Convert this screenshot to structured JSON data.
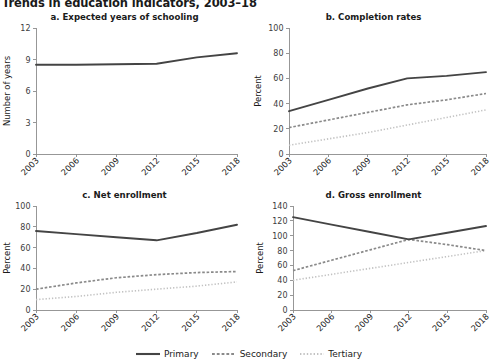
{
  "figure": {
    "title": "Trends in education indicators, 2003–18"
  },
  "legend": {
    "position": "bottom-center",
    "items": [
      {
        "label": "Primary",
        "style": "solid",
        "color": "#444444",
        "icon": "solid-line-swatch-icon"
      },
      {
        "label": "Secondary",
        "style": "dashed",
        "color": "#8a8a8a",
        "icon": "dashed-line-swatch-icon"
      },
      {
        "label": "Tertiary",
        "style": "dotted",
        "color": "#c2c2c2",
        "icon": "dotted-line-swatch-icon"
      }
    ]
  },
  "chart_data": [
    {
      "id": "panel-a",
      "type": "line",
      "title": "a. Expected years of schooling",
      "xlabel": "",
      "ylabel": "Number of years",
      "x": [
        2003,
        2006,
        2009,
        2012,
        2015,
        2018
      ],
      "xticklabels": [
        "2003",
        "2006",
        "2009",
        "2012",
        "2015",
        "2018"
      ],
      "xlim": [
        2003,
        2018
      ],
      "ylim": [
        0,
        12
      ],
      "yticks": [
        0,
        3,
        6,
        9,
        12
      ],
      "yticklabels": [
        "0",
        "3",
        "6",
        "9",
        "12"
      ],
      "grid": false,
      "series": [
        {
          "name": "Primary",
          "values": [
            8.5,
            8.5,
            8.55,
            8.6,
            9.2,
            9.6
          ]
        }
      ]
    },
    {
      "id": "panel-b",
      "type": "line",
      "title": "b. Completion rates",
      "xlabel": "",
      "ylabel": "Percent",
      "x": [
        2003,
        2006,
        2009,
        2012,
        2015,
        2018
      ],
      "xticklabels": [
        "2003",
        "2006",
        "2009",
        "2012",
        "2015",
        "2018"
      ],
      "xlim": [
        2003,
        2018
      ],
      "ylim": [
        0,
        100
      ],
      "yticks": [
        0,
        20,
        40,
        60,
        80,
        100
      ],
      "yticklabels": [
        "0",
        "20",
        "40",
        "60",
        "80",
        "100"
      ],
      "grid": false,
      "series": [
        {
          "name": "Primary",
          "values": [
            34,
            43,
            52,
            60,
            62,
            65
          ]
        },
        {
          "name": "Secondary",
          "values": [
            21,
            27,
            33,
            39,
            43,
            48
          ]
        },
        {
          "name": "Tertiary",
          "values": [
            7,
            12,
            17,
            23,
            29,
            35
          ]
        }
      ]
    },
    {
      "id": "panel-c",
      "type": "line",
      "title": "c. Net enrollment",
      "xlabel": "",
      "ylabel": "Percent",
      "x": [
        2003,
        2006,
        2009,
        2012,
        2015,
        2018
      ],
      "xticklabels": [
        "2003",
        "2006",
        "2009",
        "2012",
        "2015",
        "2018"
      ],
      "xlim": [
        2003,
        2018
      ],
      "ylim": [
        0,
        100
      ],
      "yticks": [
        0,
        20,
        40,
        60,
        80,
        100
      ],
      "yticklabels": [
        "0",
        "20",
        "40",
        "60",
        "80",
        "100"
      ],
      "grid": false,
      "series": [
        {
          "name": "Primary",
          "values": [
            76,
            73,
            70,
            67,
            74,
            82
          ]
        },
        {
          "name": "Secondary",
          "values": [
            20,
            26,
            31,
            34,
            36,
            37
          ]
        },
        {
          "name": "Tertiary",
          "values": [
            10,
            13,
            17,
            20,
            23,
            27
          ]
        }
      ]
    },
    {
      "id": "panel-d",
      "type": "line",
      "title": "d. Gross enrollment",
      "xlabel": "",
      "ylabel": "Percent",
      "x": [
        2003,
        2006,
        2009,
        2012,
        2015,
        2018
      ],
      "xticklabels": [
        "2003",
        "2006",
        "2009",
        "2012",
        "2015",
        "2018"
      ],
      "xlim": [
        2003,
        2018
      ],
      "ylim": [
        0,
        140
      ],
      "yticks": [
        0,
        20,
        40,
        60,
        80,
        100,
        120,
        140
      ],
      "yticklabels": [
        "0",
        "20",
        "40",
        "60",
        "80",
        "100",
        "120",
        "140"
      ],
      "grid": false,
      "series": [
        {
          "name": "Primary",
          "values": [
            125,
            115,
            105,
            95,
            104,
            113
          ]
        },
        {
          "name": "Secondary",
          "values": [
            53,
            67,
            81,
            95,
            88,
            80
          ]
        },
        {
          "name": "Tertiary",
          "values": [
            40,
            48,
            56,
            64,
            72,
            80
          ]
        }
      ]
    }
  ]
}
